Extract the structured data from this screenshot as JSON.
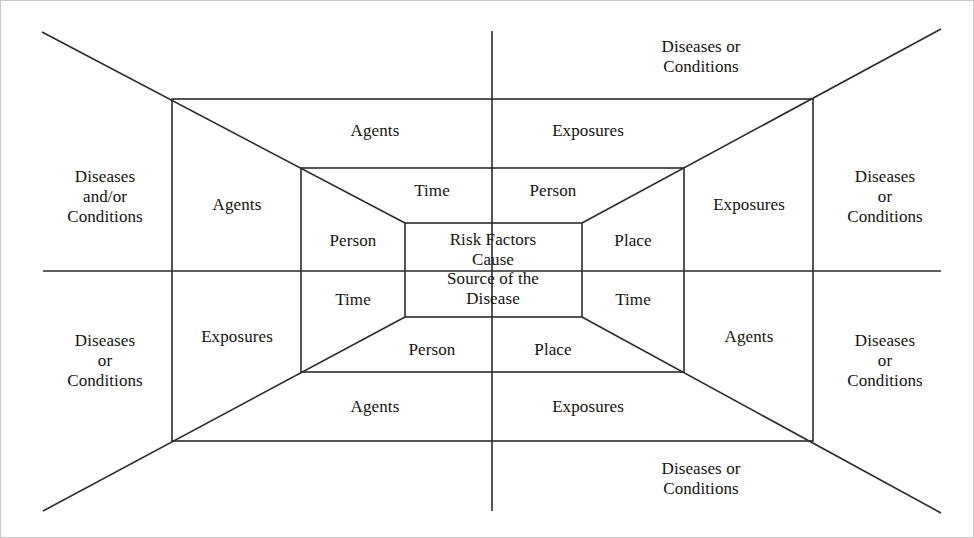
{
  "diagram": {
    "type": "one-point-perspective nested rectangles",
    "stroke_color": "#2b2b2b",
    "text_color": "#14120f",
    "background_color": "#ffffff"
  },
  "center": {
    "text": "Risk Factors\nCause\nSource of the\nDisease"
  },
  "inner_ring": {
    "top": "Time",
    "top_right": "Person",
    "right": "Place",
    "bottom_right": "Time",
    "bottom": "Place",
    "bottom_left": "Person",
    "left": "Time",
    "top_left": "Person"
  },
  "middle_ring": {
    "top_left": "Agents",
    "top_right": "Exposures",
    "left": "Agents",
    "right": "Exposures",
    "bottom_left": "Exposures",
    "bottom_right": "Agents",
    "bottom_band_left": "Agents",
    "bottom_band_right": "Exposures"
  },
  "outer_ring": {
    "top": "Diseases or\nConditions",
    "left": "Diseases\nand/or\nConditions",
    "right": "Diseases\nor\nConditions",
    "bottom_left": "Diseases\nor\nConditions",
    "bottom_right": "Diseases\nor\nConditions",
    "bottom": "Diseases or\nConditions",
    "far_right": "Diseases\nor\nConditions"
  },
  "geometry": {
    "canvas": {
      "width": 974,
      "height": 538
    },
    "outer_rect": {
      "x1": 171,
      "y1": 98,
      "x2": 812,
      "y2": 440
    },
    "middle_rect": {
      "x1": 300,
      "y1": 167,
      "x2": 683,
      "y2": 371
    },
    "inner_rect": {
      "x1": 404,
      "y1": 222,
      "x2": 581,
      "y2": 316
    },
    "vertical_axis": {
      "x": 491,
      "y1": 30,
      "y2": 510
    },
    "horizontal_axis": {
      "y": 270,
      "x1": 42,
      "x2": 940
    },
    "corner_diagonals": [
      {
        "from": [
          41,
          31
        ],
        "to": [
          404,
          222
        ]
      },
      {
        "from": [
          940,
          28
        ],
        "to": [
          581,
          222
        ]
      },
      {
        "from": [
          42,
          510
        ],
        "to": [
          404,
          316
        ]
      },
      {
        "from": [
          940,
          512
        ],
        "to": [
          581,
          316
        ]
      }
    ]
  },
  "labels": [
    {
      "name": "outer-left",
      "text": "Diseases\nand/or\nConditions",
      "x": 104,
      "y": 196,
      "size": 17
    },
    {
      "name": "outer-top-right",
      "text": "Diseases or\nConditions",
      "x": 700,
      "y": 56,
      "size": 17
    },
    {
      "name": "outer-right-upper",
      "text": "Diseases\nor\nConditions",
      "x": 884,
      "y": 196,
      "size": 17
    },
    {
      "name": "outer-left-lower",
      "text": "Diseases\nor\nConditions",
      "x": 104,
      "y": 360,
      "size": 17
    },
    {
      "name": "outer-right-lower",
      "text": "Diseases\nor\nConditions",
      "x": 884,
      "y": 360,
      "size": 17
    },
    {
      "name": "outer-bottom",
      "text": "Diseases or\nConditions",
      "x": 700,
      "y": 478,
      "size": 17
    },
    {
      "name": "band-top-left",
      "text": "Agents",
      "x": 374,
      "y": 130,
      "size": 17
    },
    {
      "name": "band-top-right",
      "text": "Exposures",
      "x": 587,
      "y": 130,
      "size": 17
    },
    {
      "name": "band-left-upper",
      "text": "Agents",
      "x": 236,
      "y": 204,
      "size": 17
    },
    {
      "name": "band-right-upper",
      "text": "Exposures",
      "x": 748,
      "y": 204,
      "size": 17
    },
    {
      "name": "band-left-lower",
      "text": "Exposures",
      "x": 236,
      "y": 336,
      "size": 17
    },
    {
      "name": "band-right-lower",
      "text": "Agents",
      "x": 748,
      "y": 336,
      "size": 17
    },
    {
      "name": "band-bottom-left",
      "text": "Agents",
      "x": 374,
      "y": 406,
      "size": 17
    },
    {
      "name": "band-bottom-right",
      "text": "Exposures",
      "x": 587,
      "y": 406,
      "size": 17
    },
    {
      "name": "inner-top-left",
      "text": "Time",
      "x": 431,
      "y": 190,
      "size": 17
    },
    {
      "name": "inner-top-right",
      "text": "Person",
      "x": 552,
      "y": 190,
      "size": 17
    },
    {
      "name": "inner-left-upper",
      "text": "Person",
      "x": 352,
      "y": 240,
      "size": 17
    },
    {
      "name": "inner-right-upper",
      "text": "Place",
      "x": 632,
      "y": 240,
      "size": 17
    },
    {
      "name": "inner-left-lower",
      "text": "Time",
      "x": 352,
      "y": 299,
      "size": 17
    },
    {
      "name": "inner-right-lower",
      "text": "Time",
      "x": 632,
      "y": 299,
      "size": 17
    },
    {
      "name": "inner-bottom-left",
      "text": "Person",
      "x": 431,
      "y": 349,
      "size": 17
    },
    {
      "name": "inner-bottom-right",
      "text": "Place",
      "x": 552,
      "y": 349,
      "size": 17
    },
    {
      "name": "core-text",
      "text": "Risk Factors\nCause\nSource of the\nDisease",
      "x": 492,
      "y": 268,
      "size": 17
    }
  ]
}
